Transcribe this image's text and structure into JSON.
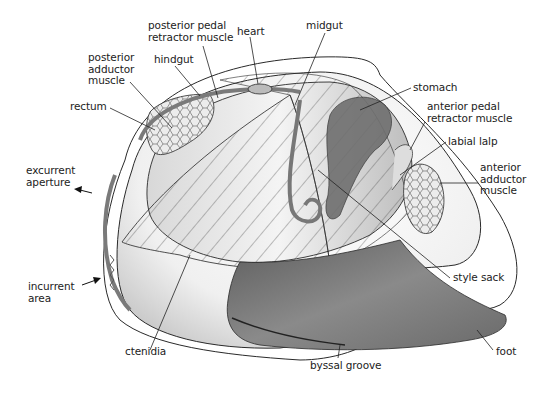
{
  "diagram": {
    "colors": {
      "background": "#ffffff",
      "outline": "#2a2a2a",
      "shell_fill": "#f2f2f2",
      "muscle_fill": "#e4e4e4",
      "dark_tissue": "#6e6e6e",
      "foot": "#7a7a7a",
      "text": "#222222"
    },
    "labels": [
      {
        "id": "posterior-pedal-retractor-muscle",
        "text": "posterior pedal\nretractor muscle",
        "x": 148,
        "y": 22
      },
      {
        "id": "heart",
        "text": "heart",
        "x": 237,
        "y": 27
      },
      {
        "id": "midgut",
        "text": "midgut",
        "x": 306,
        "y": 22
      },
      {
        "id": "hindgut",
        "text": "hindgut",
        "x": 154,
        "y": 55
      },
      {
        "id": "posterior-adductor-muscle",
        "text": "posterior\nadductor\nmuscle",
        "x": 88,
        "y": 52
      },
      {
        "id": "rectum",
        "text": "rectum",
        "x": 70,
        "y": 101
      },
      {
        "id": "stomach",
        "text": "stomach",
        "x": 413,
        "y": 82
      },
      {
        "id": "anterior-pedal-retractor-muscle",
        "text": "anterior pedal\nretractor muscle",
        "x": 427,
        "y": 102
      },
      {
        "id": "labial-lalp",
        "text": "labial lalp",
        "x": 448,
        "y": 137
      },
      {
        "id": "anterior-adductor-muscle",
        "text": "anterior\nadductor\nmuscle",
        "x": 480,
        "y": 163
      },
      {
        "id": "excurrent-aperture",
        "text": "excurrent\naperture",
        "x": 26,
        "y": 166
      },
      {
        "id": "style-sack",
        "text": "style sack",
        "x": 453,
        "y": 271
      },
      {
        "id": "incurrent-area",
        "text": "incurrent\narea",
        "x": 28,
        "y": 283
      },
      {
        "id": "ctenidia",
        "text": "ctenidia",
        "x": 125,
        "y": 345
      },
      {
        "id": "foot",
        "text": "foot",
        "x": 496,
        "y": 345
      },
      {
        "id": "byssal-groove",
        "text": "byssal groove",
        "x": 310,
        "y": 361
      }
    ]
  }
}
